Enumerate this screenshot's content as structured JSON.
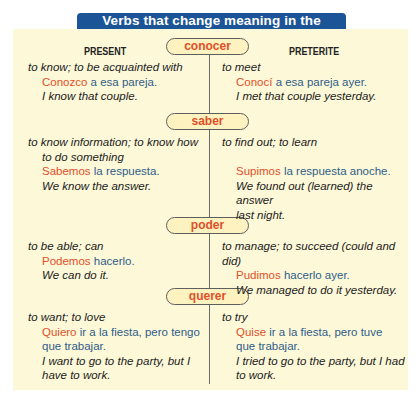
{
  "title": "Verbs that change meaning in the preterite",
  "columns": {
    "present": "PRESENT",
    "preterite": "PRETERITE"
  },
  "colors": {
    "title_bg": "#1b5497",
    "box_bg": "#fdf8d8",
    "verb": "#e0502a",
    "spanish": "#2f5d8a"
  },
  "verbs": [
    {
      "name": "conocer",
      "present": {
        "meaning": "to know; to be acquainted with",
        "meaning_cont": "",
        "verb": "Conozco",
        "rest": " a esa pareja.",
        "translation": "I know that couple.",
        "translation_cont": ""
      },
      "preterite": {
        "meaning": "to meet",
        "verb": "Conocí",
        "rest": " a esa pareja ayer.",
        "translation": "I met that couple yesterday.",
        "translation_cont": ""
      }
    },
    {
      "name": "saber",
      "present": {
        "meaning": "to know information; to know how",
        "meaning_cont": "to do something",
        "verb": "Sabemos",
        "rest": " la respuesta.",
        "translation": "We know the answer.",
        "translation_cont": ""
      },
      "preterite": {
        "meaning": "to find out; to learn",
        "verb": "Supimos",
        "rest": " la respuesta anoche.",
        "translation": "We found out (learned) the answer",
        "translation_cont": "last night."
      }
    },
    {
      "name": "poder",
      "present": {
        "meaning": "to be able; can",
        "meaning_cont": "",
        "verb": "Podemos",
        "rest": " hacerlo.",
        "translation": "We can do it.",
        "translation_cont": ""
      },
      "preterite": {
        "meaning": "to manage; to succeed (could and did)",
        "verb": "Pudimos",
        "rest": " hacerlo ayer.",
        "translation": "We managed to do it yesterday.",
        "translation_cont": ""
      }
    },
    {
      "name": "querer",
      "present": {
        "meaning": "to want; to love",
        "meaning_cont": "",
        "verb": "Quiero",
        "rest": " ir a la fiesta, pero tengo",
        "rest_cont": "que trabajar.",
        "translation": "I want to go to the party, but I",
        "translation_cont": "have to work."
      },
      "preterite": {
        "meaning": "to try",
        "verb": "Quise",
        "rest": " ir a la fiesta, pero tuve",
        "rest_cont": "que trabajar.",
        "translation": "I tried to go to the party, but I had",
        "translation_cont": "to work."
      }
    }
  ]
}
